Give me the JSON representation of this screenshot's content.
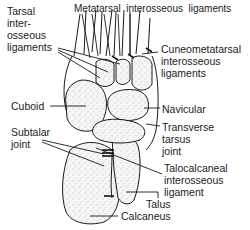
{
  "figure": {
    "labels": {
      "tarsal_interosseous": "Tarsal\ninter-\nosseous\nligaments",
      "metatarsal_interosseous": "Metatarsal  interosseous  ligaments",
      "cuneometatarsal": "Cuneometatarsal\ninterosseous\nligaments",
      "cuboid": "Cuboid",
      "navicular": "Navicular",
      "subtalar_joint": "Subtalar\njoint",
      "transverse_tarsus_joint": "Transverse\ntarsus\njoint",
      "talocalcaneal": "Talocalcaneal\ninterosseous\nligament",
      "talus": "Talus",
      "calcaneus": "Calcaneus"
    },
    "colors": {
      "line": "#1a1a1a",
      "bone_fill": "#f4f4f4",
      "background": "#ffffff"
    }
  }
}
